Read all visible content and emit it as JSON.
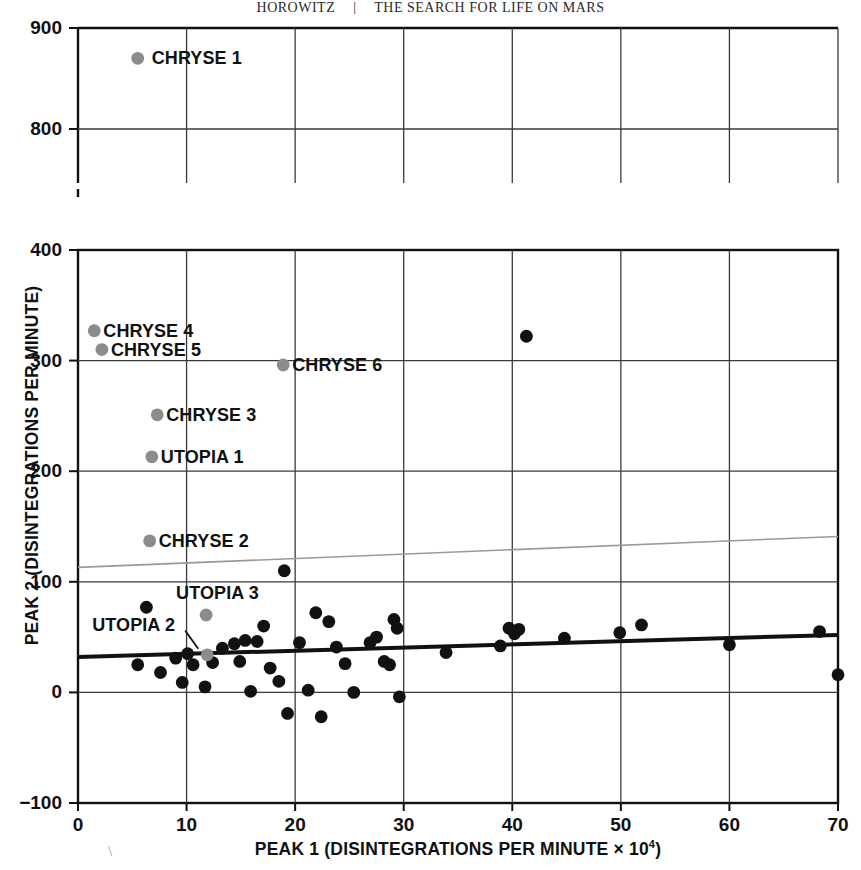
{
  "header": {
    "left_text": "HOROWITZ",
    "separator": "|",
    "right_text": "THE SEARCH FOR LIFE ON MARS"
  },
  "chart_data": {
    "type": "scatter",
    "title": "",
    "xlabel": "PEAK 1 (DISINTEGRATIONS PER MINUTE × 10⁴)",
    "xlabel_main": "PEAK 1 (DISINTEGRATIONS PER MINUTE × 10",
    "xlabel_exponent": "4",
    "xlabel_close": ")",
    "ylabel": "PEAK 2 (DISINTEGRATIONS PER MINUTE)",
    "xlim": [
      0,
      70
    ],
    "ylim_lower": [
      -100,
      400
    ],
    "ylim_upper": [
      750,
      900
    ],
    "axis_break": true,
    "grid": true,
    "legend": "none",
    "xticks": [
      0,
      10,
      20,
      30,
      40,
      50,
      60,
      70
    ],
    "xtick_labels": [
      "0",
      "10",
      "20",
      "30",
      "40",
      "50",
      "60",
      "70"
    ],
    "yticks_lower": [
      -100,
      0,
      100,
      200,
      300,
      400
    ],
    "ytick_labels_lower": [
      "−100",
      "0",
      "100",
      "200",
      "300",
      "400"
    ],
    "yticks_upper": [
      800,
      900
    ],
    "ytick_labels_upper": [
      "800",
      "900"
    ],
    "series": [
      {
        "name": "unlabeled samples",
        "color": "#111111",
        "marker": "filled-circle",
        "points": [
          [
            5.5,
            25
          ],
          [
            6.3,
            77
          ],
          [
            7.6,
            18
          ],
          [
            9.0,
            31
          ],
          [
            9.6,
            9
          ],
          [
            10.1,
            35
          ],
          [
            10.6,
            25
          ],
          [
            11.7,
            5
          ],
          [
            12.4,
            27
          ],
          [
            13.3,
            40
          ],
          [
            14.4,
            44
          ],
          [
            14.9,
            28
          ],
          [
            15.4,
            47
          ],
          [
            15.9,
            1
          ],
          [
            16.5,
            46
          ],
          [
            17.1,
            60
          ],
          [
            17.7,
            22
          ],
          [
            18.5,
            10
          ],
          [
            19.0,
            110
          ],
          [
            19.3,
            -19
          ],
          [
            20.4,
            45
          ],
          [
            21.2,
            2
          ],
          [
            21.9,
            72
          ],
          [
            22.4,
            -22
          ],
          [
            23.1,
            64
          ],
          [
            23.8,
            41
          ],
          [
            24.6,
            26
          ],
          [
            25.4,
            0
          ],
          [
            26.9,
            45
          ],
          [
            27.5,
            50
          ],
          [
            28.2,
            28
          ],
          [
            28.7,
            25
          ],
          [
            29.1,
            66
          ],
          [
            29.4,
            58
          ],
          [
            29.6,
            -4
          ],
          [
            33.9,
            36
          ],
          [
            38.9,
            42
          ],
          [
            39.7,
            58
          ],
          [
            40.2,
            53
          ],
          [
            40.6,
            57
          ],
          [
            41.3,
            322
          ],
          [
            44.8,
            49
          ],
          [
            49.9,
            54
          ],
          [
            51.9,
            61
          ],
          [
            60.0,
            43
          ],
          [
            68.3,
            55
          ],
          [
            70.0,
            16
          ]
        ]
      },
      {
        "name": "labeled Mars samples",
        "color": "#8c8c8c",
        "marker": "filled-circle",
        "points": [
          {
            "label": "CHRYSE 1",
            "x": 5.5,
            "y": 870,
            "label_side": "right"
          },
          {
            "label": "CHRYSE 4",
            "x": 1.5,
            "y": 327,
            "label_side": "right"
          },
          {
            "label": "CHRYSE 5",
            "x": 2.2,
            "y": 310,
            "label_side": "right"
          },
          {
            "label": "CHRYSE 6",
            "x": 18.9,
            "y": 296,
            "label_side": "right"
          },
          {
            "label": "CHRYSE 3",
            "x": 7.3,
            "y": 251,
            "label_side": "right"
          },
          {
            "label": "UTOPIA 1",
            "x": 6.8,
            "y": 213,
            "label_side": "right"
          },
          {
            "label": "CHRYSE 2",
            "x": 6.6,
            "y": 137,
            "label_side": "right"
          },
          {
            "label": "UTOPIA 3",
            "x": 11.8,
            "y": 70,
            "label_side": "above"
          },
          {
            "label": "UTOPIA 2",
            "x": 11.9,
            "y": 34,
            "label_side": "leader"
          }
        ]
      }
    ],
    "lines": [
      {
        "name": "regression-line-terrestrial",
        "color": "#111111",
        "width": 4,
        "x0": 0,
        "y0": 32,
        "x1": 70,
        "y1": 52
      },
      {
        "name": "upper-bound-line",
        "color": "#9a9a9a",
        "width": 1.6,
        "x0": 0,
        "y0": 113,
        "x1": 70,
        "y1": 141
      }
    ]
  },
  "point_labels": {
    "chryse_1": "CHRYSE 1",
    "chryse_2": "CHRYSE 2",
    "chryse_3": "CHRYSE 3",
    "chryse_4": "CHRYSE 4",
    "chryse_5": "CHRYSE 5",
    "chryse_6": "CHRYSE 6",
    "utopia_1": "UTOPIA 1",
    "utopia_2": "UTOPIA 2",
    "utopia_3": "UTOPIA 3"
  }
}
